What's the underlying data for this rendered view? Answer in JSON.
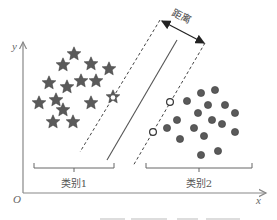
{
  "diagram": {
    "axes": {
      "y_label": "y",
      "x_label": "x",
      "origin_label": "O"
    },
    "distance_label": "距离",
    "categories": [
      {
        "label": "类别1",
        "shape": "star",
        "color": "#555555"
      },
      {
        "label": "类别2",
        "shape": "circle",
        "color": "#555555"
      }
    ],
    "lines": {
      "separator": "solid",
      "margins": "dashed"
    },
    "support_vectors": {
      "style": "hollow",
      "stars": 1,
      "circles": 2
    },
    "colors": {
      "marker_fill": "#5a5a5a",
      "marker_stroke": "#333333",
      "line": "#555555",
      "axis": "#888888"
    }
  }
}
